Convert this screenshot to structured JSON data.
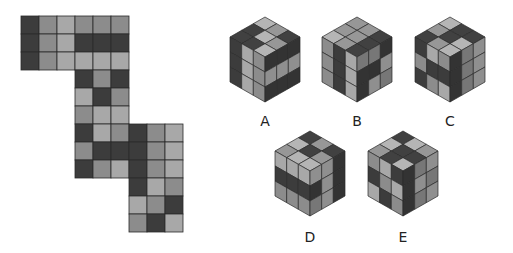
{
  "palette": {
    "D": "#3c3c3c",
    "M": "#8c8c8c",
    "L": "#a8a8a8",
    "grid": "#2a2a2a"
  },
  "net": {
    "origin": [
      21,
      16
    ],
    "cell": 18,
    "faces": [
      {
        "name": "face-1",
        "col": 0,
        "row": 0,
        "cells": [
          [
            "D",
            "M",
            "L"
          ],
          [
            "D",
            "M",
            "L"
          ],
          [
            "D",
            "M",
            "L"
          ]
        ]
      },
      {
        "name": "face-2",
        "col": 3,
        "row": 0,
        "cells": [
          [
            "M",
            "M",
            "M"
          ],
          [
            "D",
            "D",
            "D"
          ],
          [
            "L",
            "L",
            "L"
          ]
        ]
      },
      {
        "name": "face-3",
        "col": 3,
        "row": 3,
        "cells": [
          [
            "D",
            "M",
            "D"
          ],
          [
            "L",
            "D",
            "M"
          ],
          [
            "M",
            "L",
            "L"
          ]
        ]
      },
      {
        "name": "face-4",
        "col": 3,
        "row": 6,
        "cells": [
          [
            "D",
            "L",
            "M"
          ],
          [
            "M",
            "D",
            "D"
          ],
          [
            "D",
            "M",
            "L"
          ]
        ]
      },
      {
        "name": "face-5",
        "col": 6,
        "row": 6,
        "cells": [
          [
            "D",
            "M",
            "L"
          ],
          [
            "D",
            "M",
            "L"
          ],
          [
            "D",
            "M",
            "L"
          ]
        ]
      },
      {
        "name": "face-6",
        "col": 6,
        "row": 9,
        "cells": [
          [
            "D",
            "L",
            "M"
          ],
          [
            "L",
            "M",
            "D"
          ],
          [
            "M",
            "D",
            "L"
          ]
        ]
      }
    ]
  },
  "options": [
    {
      "label": "A",
      "cx": 265,
      "ty": 17,
      "label_y": 113,
      "top": [
        [
          "L",
          "M",
          "D"
        ],
        [
          "D",
          "L",
          "M"
        ],
        [
          "D",
          "D",
          "L"
        ]
      ],
      "left": [
        [
          "D",
          "L",
          "M"
        ],
        [
          "D",
          "L",
          "M"
        ],
        [
          "D",
          "L",
          "M"
        ]
      ],
      "right": [
        [
          "D",
          "D",
          "D"
        ],
        [
          "L",
          "L",
          "L"
        ],
        [
          "D",
          "D",
          "D"
        ]
      ]
    },
    {
      "label": "B",
      "cx": 357,
      "ty": 17,
      "label_y": 113,
      "top": [
        [
          "M",
          "M",
          "D"
        ],
        [
          "M",
          "M",
          "D"
        ],
        [
          "L",
          "M",
          "D"
        ]
      ],
      "left": [
        [
          "M",
          "D",
          "L"
        ],
        [
          "M",
          "D",
          "L"
        ],
        [
          "M",
          "D",
          "L"
        ]
      ],
      "right": [
        [
          "M",
          "M",
          "D"
        ],
        [
          "D",
          "D",
          "L"
        ],
        [
          "D",
          "L",
          "M"
        ]
      ]
    },
    {
      "label": "C",
      "cx": 450,
      "ty": 17,
      "label_y": 113,
      "top": [
        [
          "L",
          "D",
          "D"
        ],
        [
          "M",
          "D",
          "L"
        ],
        [
          "D",
          "M",
          "L"
        ]
      ],
      "left": [
        [
          "D",
          "L",
          "M"
        ],
        [
          "M",
          "D",
          "D"
        ],
        [
          "D",
          "M",
          "L"
        ]
      ],
      "right": [
        [
          "D",
          "M",
          "L"
        ],
        [
          "D",
          "M",
          "L"
        ],
        [
          "D",
          "M",
          "L"
        ]
      ]
    },
    {
      "label": "D",
      "cx": 310,
      "ty": 131,
      "label_y": 229,
      "top": [
        [
          "D",
          "M",
          "D"
        ],
        [
          "L",
          "D",
          "M"
        ],
        [
          "M",
          "L",
          "L"
        ]
      ],
      "left": [
        [
          "L",
          "L",
          "L"
        ],
        [
          "D",
          "D",
          "D"
        ],
        [
          "M",
          "M",
          "M"
        ]
      ],
      "right": [
        [
          "L",
          "L",
          "D"
        ],
        [
          "D",
          "L",
          "D"
        ],
        [
          "M",
          "L",
          "D"
        ]
      ]
    },
    {
      "label": "E",
      "cx": 403,
      "ty": 131,
      "label_y": 229,
      "top": [
        [
          "D",
          "L",
          "M"
        ],
        [
          "L",
          "D",
          "D"
        ],
        [
          "M",
          "D",
          "L"
        ]
      ],
      "left": [
        [
          "M",
          "L",
          "D"
        ],
        [
          "D",
          "M",
          "L"
        ],
        [
          "L",
          "D",
          "M"
        ]
      ],
      "right": [
        [
          "D",
          "M",
          "L"
        ],
        [
          "D",
          "L",
          "M"
        ],
        [
          "D",
          "M",
          "L"
        ]
      ]
    }
  ],
  "cube_geometry": {
    "half_width": 35,
    "top_half_height": 20,
    "side_height": 45
  }
}
